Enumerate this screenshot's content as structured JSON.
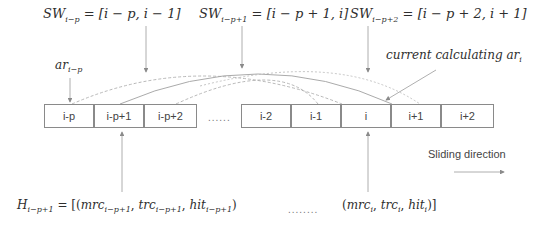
{
  "sliding_windows": [
    {
      "base": "SW",
      "sub": "i−p",
      "eq": "= [i − p, i − 1]"
    },
    {
      "base": "SW",
      "sub": "i−p+1",
      "eq": "= [i − p + 1, i]"
    },
    {
      "base": "SW",
      "sub": "i−p+2",
      "eq": "= [i − p + 2, i + 1]"
    }
  ],
  "ar_label": {
    "base": "ar",
    "sub": "i−p"
  },
  "current_label": {
    "text": "current calculating ar",
    "sub": "i"
  },
  "cells_left": [
    "i-p",
    "i-p+1",
    "i-p+2"
  ],
  "ellipsis_middle": "......",
  "cells_right": [
    "i-2",
    "i-1",
    "i",
    "i+1",
    "i+2"
  ],
  "sliding_direction": "Sliding direction",
  "history": {
    "base": "H",
    "sub": "i−p+1",
    "eq_open": "= [(",
    "first_tuple": {
      "mrc": "mrc",
      "trc": "trc",
      "hit": "hit",
      "sub": "i−p+1"
    },
    "ellipsis": "........",
    "last_tuple": {
      "mrc": "mrc",
      "trc": "trc",
      "hit": "hit",
      "sub": "i"
    }
  },
  "colors": {
    "line": "#9a9a9a",
    "border": "#8a8a8a",
    "text": "#2e2e2e"
  }
}
